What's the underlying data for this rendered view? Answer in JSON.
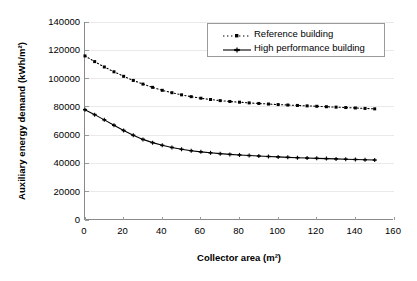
{
  "chart_data": {
    "type": "line",
    "title": "",
    "xlabel": "Collector area (m²)",
    "ylabel": "Auxiliary energy demand (kWh/m²)",
    "xlim": [
      0,
      160
    ],
    "ylim": [
      0,
      140000
    ],
    "xticks": [
      0,
      20,
      40,
      60,
      80,
      100,
      120,
      140,
      160
    ],
    "xtick_labels": [
      "0",
      "20",
      "40",
      "60",
      "80",
      "100",
      "120",
      "140",
      "160"
    ],
    "yticks": [
      0,
      20000,
      40000,
      60000,
      80000,
      100000,
      120000,
      140000
    ],
    "ytick_labels": [
      "0",
      "20000",
      "40000",
      "60000",
      "80000",
      "100000",
      "120000",
      "140000"
    ],
    "grid": "horizontal-faint",
    "legend_position": "top-right-inside",
    "x": [
      0,
      5,
      10,
      15,
      20,
      25,
      30,
      35,
      40,
      45,
      50,
      55,
      60,
      65,
      70,
      75,
      80,
      85,
      90,
      95,
      100,
      105,
      110,
      115,
      120,
      125,
      130,
      135,
      140,
      145,
      150
    ],
    "series": [
      {
        "name": "Reference building",
        "style": "dotted",
        "marker": "square",
        "color": "#000000",
        "values": [
          116000,
          112000,
          108200,
          104800,
          101600,
          98700,
          96100,
          93800,
          91700,
          90000,
          88500,
          87200,
          86100,
          85200,
          84400,
          83800,
          83300,
          82800,
          82400,
          82000,
          81600,
          81300,
          81000,
          80700,
          80400,
          80100,
          79800,
          79500,
          79200,
          78900,
          78600
        ]
      },
      {
        "name": "High performance building",
        "style": "solid",
        "marker": "cross",
        "color": "#000000",
        "values": [
          78000,
          74500,
          70800,
          67000,
          63300,
          59900,
          57000,
          54700,
          52800,
          51300,
          50000,
          49000,
          48200,
          47500,
          46900,
          46400,
          46000,
          45600,
          45200,
          44900,
          44600,
          44300,
          44050,
          43800,
          43600,
          43400,
          43200,
          43000,
          42800,
          42600,
          42400
        ]
      }
    ]
  },
  "axes": {
    "xlabel": "Collector area (m²)",
    "ylabel": "Auxiliary energy demand (kWh/m²)"
  },
  "legend": {
    "items": [
      {
        "label": "Reference building"
      },
      {
        "label": "High performance building"
      }
    ]
  }
}
